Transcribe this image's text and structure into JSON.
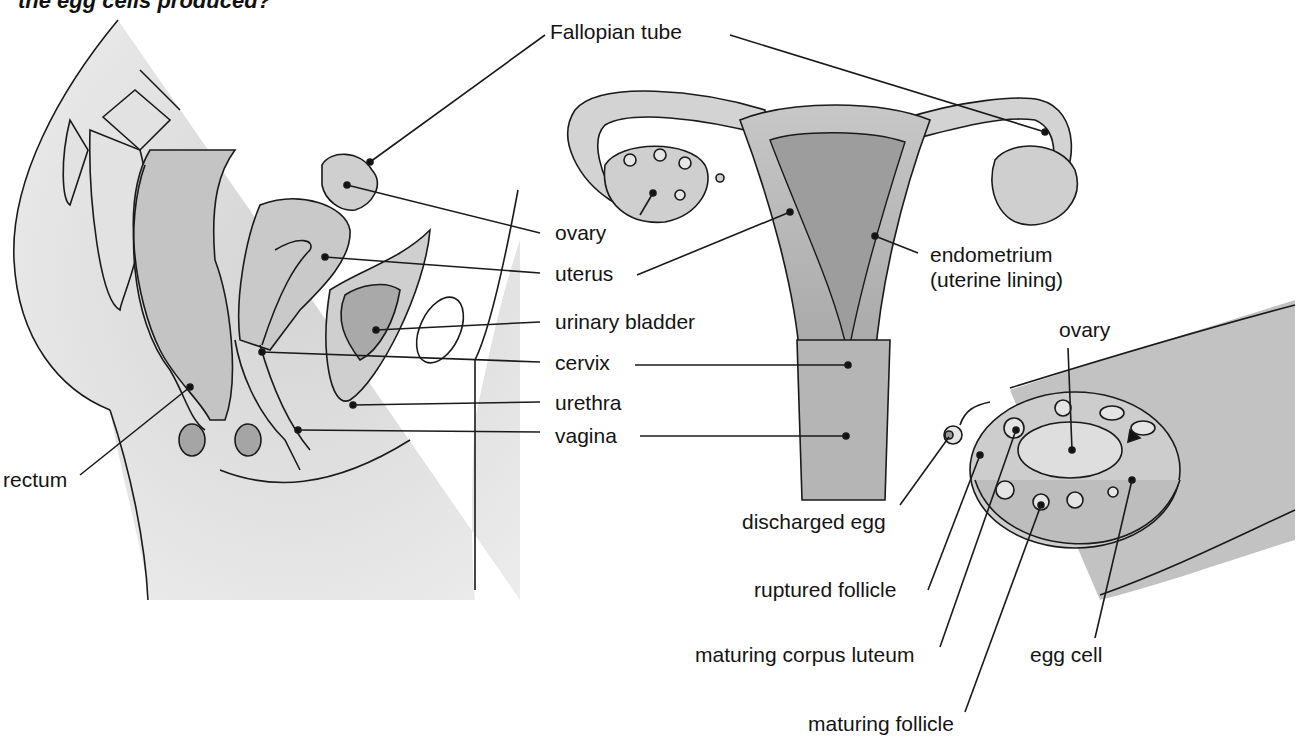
{
  "header": {
    "question_fragment": "the egg cells produced?"
  },
  "side_view": {
    "title": "Female reproductive system — side (sagittal) view",
    "labels": {
      "fallopian_tube": "Fallopian tube",
      "ovary": "ovary",
      "uterus": "uterus",
      "urinary_bladder": "urinary bladder",
      "cervix": "cervix",
      "urethra": "urethra",
      "vagina": "vagina",
      "rectum": "rectum"
    }
  },
  "front_view": {
    "title": "Uterus and Fallopian tubes — front view",
    "labels": {
      "endometrium": "endometrium",
      "endometrium_sub": "(uterine lining)"
    }
  },
  "ovary_detail": {
    "title": "Ovary cross-section",
    "labels": {
      "ovary": "ovary",
      "discharged_egg": "discharged egg",
      "ruptured_follicle": "ruptured follicle",
      "maturing_corpus_luteum": "maturing corpus luteum",
      "egg_cell": "egg cell",
      "maturing_follicle": "maturing follicle"
    }
  },
  "colors": {
    "tissue_light": "#d9d9d9",
    "tissue_mid": "#bdbdbd",
    "tissue_dark": "#9a9a9a",
    "outline": "#1a1a1a",
    "background": "#ffffff"
  }
}
